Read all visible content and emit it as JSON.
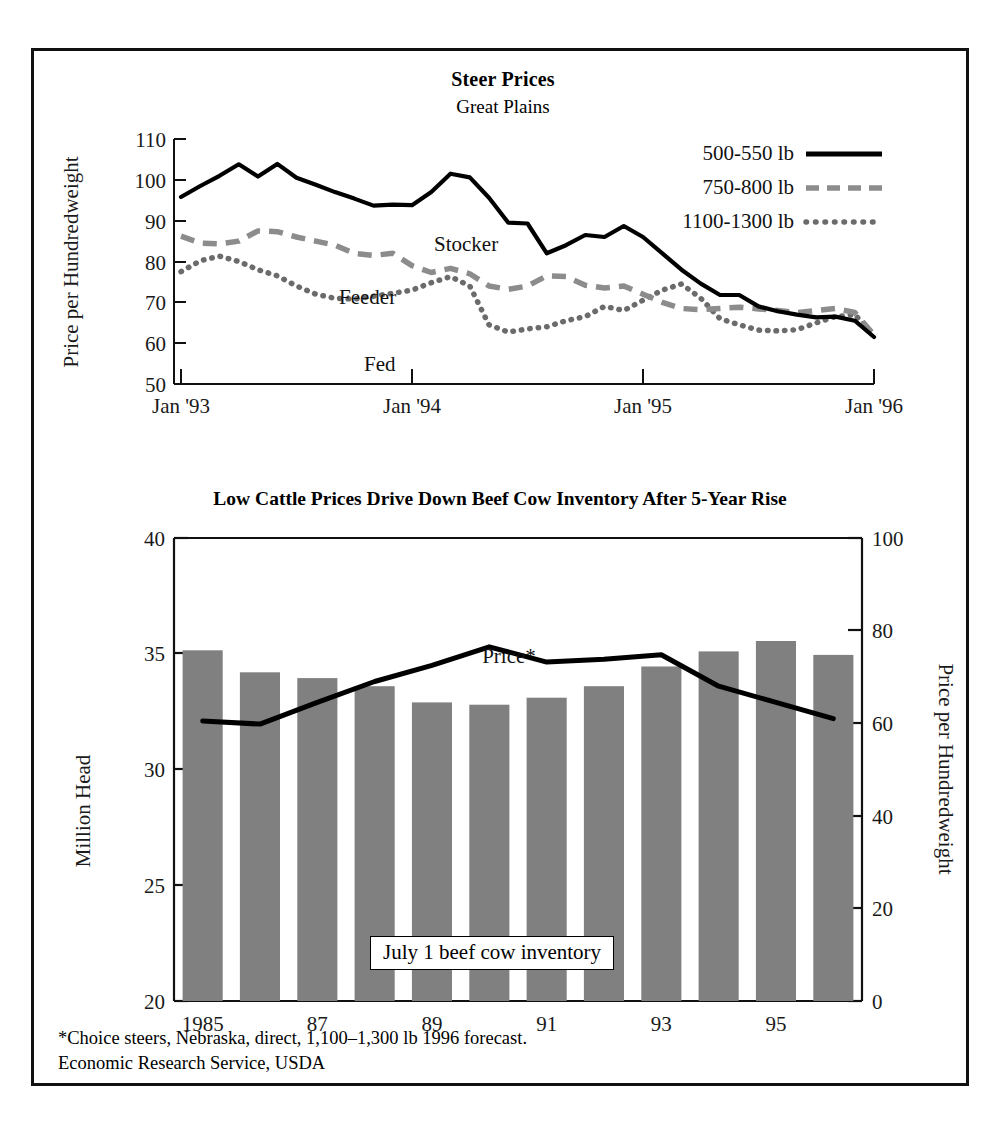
{
  "figure": {
    "background": "#ffffff",
    "frame_color": "#111111"
  },
  "top_chart": {
    "title": "Steer Prices",
    "subtitle": "Great Plains",
    "ylabel": "Price per Hundredweight",
    "y_ticks": [
      "50",
      "60",
      "70",
      "80",
      "90",
      "100",
      "110"
    ],
    "x_ticks": [
      "Jan '93",
      "Jan '94",
      "Jan '95",
      "Jan '96"
    ],
    "annotations": [
      {
        "name": "stocker-label",
        "text": "Stocker"
      },
      {
        "name": "feeder-label",
        "text": "Feeder"
      },
      {
        "name": "fed-label",
        "text": "Fed"
      }
    ],
    "legend": [
      {
        "label": "500-550 lb",
        "style": "solid",
        "color": "#000000"
      },
      {
        "label": "750-800 lb",
        "style": "dashed",
        "color": "#8c8c8c"
      },
      {
        "label": "1100-1300 lb",
        "style": "dotted",
        "color": "#6b6b6b"
      }
    ]
  },
  "bottom_chart": {
    "title": "Low Cattle Prices Drive Down Beef Cow Inventory After 5-Year Rise",
    "ylabel_left": "Million Head",
    "ylabel_right": "Price per Hundredweight",
    "y_ticks_left": [
      "20",
      "25",
      "30",
      "35",
      "40"
    ],
    "y_ticks_right": [
      "0",
      "20",
      "40",
      "60",
      "80",
      "100"
    ],
    "x_ticks": [
      "1985",
      "87",
      "89",
      "91",
      "93",
      "95"
    ],
    "bar_annotation": "July 1 beef cow inventory",
    "line_annotation": "Price*",
    "bar_color": "#808080"
  },
  "footnote": {
    "line1": "*Choice steers, Nebraska, direct, 1,100–1,300 lb 1996 forecast.",
    "line2": "Economic Research Service, USDA"
  },
  "chart_data": [
    {
      "type": "line",
      "title": "Steer Prices",
      "subtitle": "Great Plains",
      "xlabel": "",
      "ylabel": "Price per Hundredweight",
      "ylim": [
        50,
        110
      ],
      "xlim": [
        "Jan 1993",
        "Jan 1996"
      ],
      "grid": false,
      "legend_position": "top-right",
      "x": [
        "Jan 93",
        "Feb 93",
        "Mar 93",
        "Apr 93",
        "May 93",
        "Jun 93",
        "Jul 93",
        "Aug 93",
        "Sep 93",
        "Oct 93",
        "Nov 93",
        "Dec 93",
        "Jan 94",
        "Feb 94",
        "Mar 94",
        "Apr 94",
        "May 94",
        "Jun 94",
        "Jul 94",
        "Aug 94",
        "Sep 94",
        "Oct 94",
        "Nov 94",
        "Dec 94",
        "Jan 95",
        "Feb 95",
        "Mar 95",
        "Apr 95",
        "May 95",
        "Jun 95",
        "Jul 95",
        "Aug 95",
        "Sep 95",
        "Oct 95",
        "Nov 95",
        "Dec 95",
        "Jan 96"
      ],
      "series": [
        {
          "name": "500-550 lb",
          "annotation": "Stocker",
          "style": "solid",
          "color": "#000000",
          "values": [
            95.8,
            98.5,
            101.0,
            103.8,
            100.8,
            103.9,
            100.5,
            98.8,
            97.0,
            95.4,
            93.7,
            93.9,
            93.8,
            97.0,
            101.5,
            100.6,
            95.6,
            89.5,
            89.3,
            82.0,
            84.0,
            86.5,
            86.0,
            88.7,
            86.0,
            82.0,
            78.0,
            74.6,
            71.8,
            71.8,
            69.0,
            67.8,
            67.0,
            66.3,
            66.5,
            65.5,
            61.5
          ]
        },
        {
          "name": "750-800 lb",
          "annotation": "Feeder",
          "style": "dashed",
          "color": "#8c8c8c",
          "values": [
            86.2,
            84.5,
            84.3,
            85.0,
            87.5,
            87.3,
            86.0,
            85.0,
            84.0,
            82.0,
            81.5,
            82.0,
            79.0,
            77.3,
            78.3,
            77.0,
            74.0,
            73.2,
            74.0,
            76.5,
            76.3,
            74.2,
            73.5,
            74.0,
            72.0,
            70.0,
            68.5,
            68.2,
            68.5,
            68.8,
            68.4,
            68.0,
            67.5,
            68.0,
            68.5,
            67.5,
            62.0
          ]
        },
        {
          "name": "1100-1300 lb",
          "annotation": "Fed",
          "style": "dotted",
          "color": "#6b6b6b",
          "values": [
            77.5,
            80.2,
            81.3,
            80.0,
            78.0,
            76.5,
            74.0,
            72.0,
            71.0,
            70.8,
            71.5,
            72.2,
            73.0,
            74.8,
            76.3,
            74.0,
            64.5,
            62.7,
            63.5,
            64.0,
            65.5,
            66.5,
            69.0,
            68.0,
            70.5,
            73.0,
            74.5,
            71.0,
            66.0,
            64.5,
            63.2,
            63.0,
            63.3,
            65.0,
            66.5,
            67.0,
            62.0
          ]
        }
      ]
    },
    {
      "type": "bar",
      "title": "Low Cattle Prices Drive Down Beef Cow Inventory After 5-Year Rise",
      "xlabel": "",
      "ylabel": "Million Head",
      "ylabel_right": "Price per Hundredweight",
      "ylim": [
        20,
        40
      ],
      "ylim_right": [
        0,
        100
      ],
      "grid": false,
      "categories": [
        "1985",
        "1986",
        "1987",
        "1988",
        "1989",
        "1990",
        "1991",
        "1992",
        "1993",
        "1994",
        "1995",
        "1996"
      ],
      "tick_labels": [
        "1985",
        "",
        "87",
        "",
        "89",
        "",
        "91",
        "",
        "93",
        "",
        "95",
        ""
      ],
      "bar_series": {
        "name": "July 1 beef cow inventory",
        "color": "#808080",
        "values": [
          35.15,
          34.2,
          33.95,
          33.6,
          32.9,
          32.8,
          33.1,
          33.6,
          34.45,
          35.1,
          35.55,
          34.95
        ]
      },
      "line_series": {
        "name": "Price*",
        "color": "#000000",
        "axis": "right",
        "values": [
          60.5,
          59.8,
          64.5,
          69.0,
          72.5,
          76.5,
          73.2,
          73.8,
          74.8,
          68.0,
          64.5,
          61.0
        ]
      }
    }
  ]
}
